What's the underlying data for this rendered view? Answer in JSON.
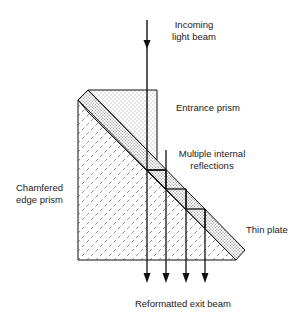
{
  "labels": {
    "incoming": [
      "Incoming",
      "light beam"
    ],
    "entrance": "Entrance prism",
    "multiple": [
      "Multiple internal",
      "reflections"
    ],
    "chamfered": [
      "Chamfered",
      "edge prism"
    ],
    "thin_plate": "Thin plate",
    "exit": "Reformatted exit beam"
  },
  "colors": {
    "line": "#111111",
    "background": "#ffffff"
  }
}
